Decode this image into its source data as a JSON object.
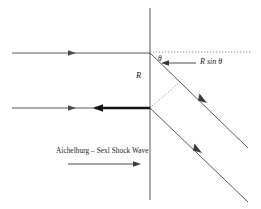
{
  "figure": {
    "background_color": "#ffffff",
    "line_color": "#4a4a4a",
    "bold_line_color": "#141414",
    "dotted_line_color": "#8a8a8a",
    "text_color": "#1a1a1a"
  },
  "labels": {
    "angle": "θ",
    "radius": "R",
    "projection": "R sin θ",
    "caption": "Aichelburg – Sexl Shock Wave"
  },
  "geometry": {
    "vertical_axis": {
      "x": 150,
      "y_top": 8,
      "y_bottom": 200
    },
    "upper_horizontal_ray": {
      "x_start": 12,
      "x_end": 150,
      "y": 53
    },
    "lower_horizontal_ray": {
      "x_start": 12,
      "x_end": 150,
      "y": 108
    },
    "bold_segment": {
      "x_start": 95,
      "x_end": 150,
      "y": 108
    },
    "dotted_horizontal": {
      "x_start": 150,
      "x_end": 252,
      "y": 52
    },
    "upper_diagonal": {
      "x_start": 150,
      "y_start": 53,
      "x_end": 248,
      "y_end": 148
    },
    "lower_diagonal": {
      "x_start": 150,
      "y_start": 108,
      "x_end": 248,
      "y_end": 202
    },
    "perpendicular_dotted": {
      "x_start": 150,
      "y_start": 108,
      "x_end": 181,
      "y_end": 81
    },
    "projection_arrow": {
      "x_tail": 196,
      "x_head": 162,
      "y": 63
    },
    "caption_arrow": {
      "x_tail": 68,
      "x_head": 140,
      "y": 164
    }
  },
  "markers": {
    "upper_ray_arrow_x": 73,
    "lower_ray_arrow_x": 73,
    "bold_segment_arrow_x": 99,
    "upper_diagonal_marker": {
      "x": 203,
      "y": 100
    },
    "lower_diagonal_marker": {
      "x": 198,
      "y": 150
    }
  }
}
